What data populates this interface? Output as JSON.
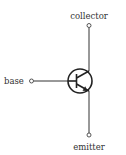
{
  "diagram": {
    "component": "npn-transistor",
    "terminals": [
      {
        "id": "collector",
        "label": "collector"
      },
      {
        "id": "base",
        "label": "base"
      },
      {
        "id": "emitter",
        "label": "emitter"
      }
    ],
    "colors": {
      "line": "#333333",
      "text": "#333333",
      "background": "#ffffff"
    }
  }
}
